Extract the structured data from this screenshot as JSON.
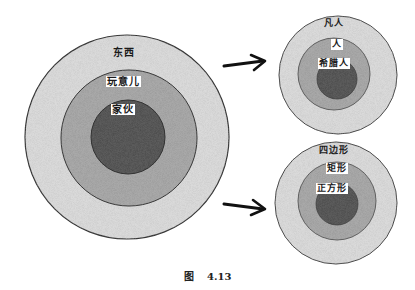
{
  "figure": {
    "caption": {
      "prefix": "图",
      "number": "4.13"
    },
    "main_diagram": {
      "levels": [
        {
          "label": "东西",
          "role": "outer"
        },
        {
          "label": "玩意儿",
          "role": "middle"
        },
        {
          "label": "家伙",
          "role": "inner"
        }
      ]
    },
    "example_top": {
      "levels": [
        {
          "label": "凡人",
          "role": "outer"
        },
        {
          "label": "人",
          "role": "middle"
        },
        {
          "label": "希腊人",
          "role": "inner"
        }
      ]
    },
    "example_bottom": {
      "levels": [
        {
          "label": "四边形",
          "role": "outer"
        },
        {
          "label": "矩形",
          "role": "middle"
        },
        {
          "label": "正方形",
          "role": "inner"
        }
      ]
    },
    "colors": {
      "outer_fill": "#d9d9d9",
      "middle_fill": "#a8a8a8",
      "inner_fill": "#5e5e5e",
      "stroke": "#333333"
    }
  }
}
